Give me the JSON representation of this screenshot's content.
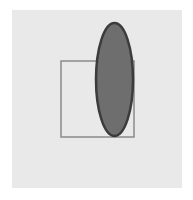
{
  "diagram": {
    "background_color": "#e9e9e9",
    "rectangle": {
      "x": 61,
      "y": 61,
      "width": 73,
      "height": 76,
      "stroke": "#8a8a8a",
      "fill": "none"
    },
    "ellipse": {
      "cx": 114.5,
      "cy": 79.5,
      "rx": 18.5,
      "ry": 56.5,
      "fill": "#6e6e6e",
      "stroke": "#3c3c3c"
    }
  }
}
